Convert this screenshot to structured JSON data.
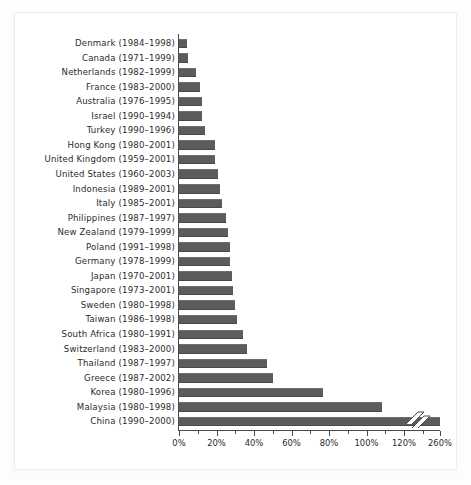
{
  "figure": {
    "background_color": "#ffffff",
    "bar_color": "#5c5c5c",
    "axis_color": "#4a4a4a",
    "frame_color": "#ededed"
  },
  "chart_data": {
    "type": "bar",
    "orientation": "horizontal",
    "title": "",
    "subtitle": "",
    "xlabel": "",
    "ylabel": "",
    "xlim": [
      0,
      140
    ],
    "grid": false,
    "legend": null,
    "axis_break": {
      "present": true,
      "between": [
        130,
        260
      ],
      "note": "China bar is truncated with a zigzag break mark; final tick jumps from 120% to 260%"
    },
    "tick_labels": [
      "0%",
      "20%",
      "40%",
      "60%",
      "80%",
      "100%",
      "120%",
      "260%"
    ],
    "tick_values": [
      0,
      20,
      40,
      60,
      80,
      100,
      120,
      260
    ],
    "categories": [
      "Denmark (1984–1998)",
      "Canada (1971–1999)",
      "Netherlands (1982–1999)",
      "France (1983–2000)",
      "Australia (1976–1995)",
      "Israel (1990–1994)",
      "Turkey (1990–1996)",
      "Hong Kong (1980–2001)",
      "United Kingdom (1959–2001)",
      "United States (1960–2003)",
      "Indonesia (1989–2001)",
      "Italy (1985–2001)",
      "Philippines (1987–1997)",
      "New Zealand (1979–1999)",
      "Poland (1991–1998)",
      "Germany (1978–1999)",
      "Japan (1970–2001)",
      "Singapore (1973–2001)",
      "Sweden (1980–1998)",
      "Taiwan (1986–1998)",
      "South Africa (1980–1991)",
      "Switzerland (1983–2000)",
      "Thailand (1987–1997)",
      "Greece (1987–2002)",
      "Korea (1980–1996)",
      "Malaysia (1980–1998)",
      "China (1990–2000)"
    ],
    "rows": [
      {
        "country": "Denmark",
        "years": "(1984–1998)",
        "value": 4
      },
      {
        "country": "Canada",
        "years": "(1971–1999)",
        "value": 5
      },
      {
        "country": "Netherlands",
        "years": "(1982–1999)",
        "value": 9
      },
      {
        "country": "France",
        "years": "(1983–2000)",
        "value": 11
      },
      {
        "country": "Australia",
        "years": "(1976–1995)",
        "value": 12
      },
      {
        "country": "Israel",
        "years": "(1990–1994)",
        "value": 12
      },
      {
        "country": "Turkey",
        "years": "(1990–1996)",
        "value": 14
      },
      {
        "country": "Hong Kong",
        "years": "(1980–2001)",
        "value": 19
      },
      {
        "country": "United Kingdom",
        "years": "(1959–2001)",
        "value": 19
      },
      {
        "country": "United States",
        "years": "(1960–2003)",
        "value": 21
      },
      {
        "country": "Indonesia",
        "years": "(1989–2001)",
        "value": 22
      },
      {
        "country": "Italy",
        "years": "(1985–2001)",
        "value": 23
      },
      {
        "country": "Philippines",
        "years": "(1987–1997)",
        "value": 25
      },
      {
        "country": "New Zealand",
        "years": "(1979–1999)",
        "value": 26
      },
      {
        "country": "Poland",
        "years": "(1991–1998)",
        "value": 27
      },
      {
        "country": "Germany",
        "years": "(1978–1999)",
        "value": 27
      },
      {
        "country": "Japan",
        "years": "(1970–2001)",
        "value": 28
      },
      {
        "country": "Singapore",
        "years": "(1973–2001)",
        "value": 29
      },
      {
        "country": "Sweden",
        "years": "(1980–1998)",
        "value": 30
      },
      {
        "country": "Taiwan",
        "years": "(1986–1998)",
        "value": 31
      },
      {
        "country": "South Africa",
        "years": "(1980–1991)",
        "value": 34
      },
      {
        "country": "Switzerland",
        "years": "(1983–2000)",
        "value": 36
      },
      {
        "country": "Thailand",
        "years": "(1987–1997)",
        "value": 47
      },
      {
        "country": "Greece",
        "years": "(1987–2002)",
        "value": 50
      },
      {
        "country": "Korea",
        "years": "(1980–1996)",
        "value": 77
      },
      {
        "country": "Malaysia",
        "years": "(1980–1998)",
        "value": 108
      },
      {
        "country": "China",
        "years": "(1990–2000)",
        "value": 260
      }
    ]
  }
}
